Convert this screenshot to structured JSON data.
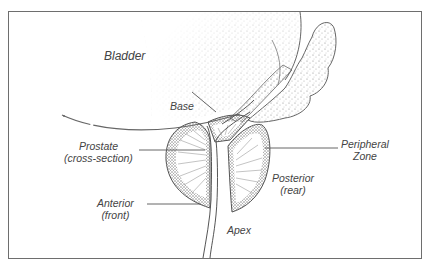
{
  "diagram": {
    "colors": {
      "frame": "#6e6e6e",
      "outline": "#555555",
      "stipple": "#8a8a8a",
      "text": "#444444"
    },
    "labels": {
      "bladder": "Bladder",
      "base": "Base",
      "prostate_line1": "Prostate",
      "prostate_line2": "(cross-section)",
      "peripheral_line1": "Peripheral",
      "peripheral_line2": "Zone",
      "anterior_line1": "Anterior",
      "anterior_line2": "(front)",
      "posterior_line1": "Posterior",
      "posterior_line2": "(rear)",
      "apex": "Apex"
    }
  }
}
